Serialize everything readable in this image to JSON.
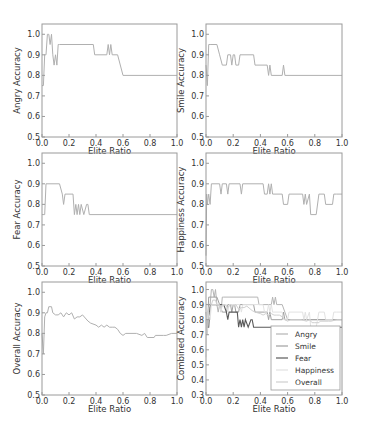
{
  "figure": {
    "xlabel": "Elite Ratio",
    "x_ticks": [
      "0.0",
      "0.2",
      "0.4",
      "0.6",
      "0.8",
      "1.0"
    ]
  },
  "chart_data": [
    {
      "type": "line",
      "title": "",
      "xlabel": "Elite Ratio",
      "ylabel": "Angry Accuracy",
      "xlim": [
        0,
        1
      ],
      "ylim": [
        0.5,
        1.05
      ],
      "y_ticks": [
        "0.5",
        "0.6",
        "0.7",
        "0.8",
        "0.9",
        "1.0"
      ],
      "grid": false,
      "series": [
        {
          "name": "Angry",
          "color": "#b0b0b0",
          "x": [
            0.0,
            0.01,
            0.02,
            0.03,
            0.04,
            0.05,
            0.06,
            0.07,
            0.08,
            0.09,
            0.1,
            0.11,
            0.12,
            0.13,
            0.38,
            0.39,
            0.48,
            0.49,
            0.5,
            0.51,
            0.52,
            0.56,
            0.6,
            1.0
          ],
          "y": [
            0.75,
            0.75,
            0.9,
            0.9,
            1.0,
            1.0,
            0.95,
            1.0,
            0.9,
            0.85,
            0.9,
            0.85,
            0.95,
            0.95,
            0.95,
            0.9,
            0.9,
            0.95,
            0.9,
            0.95,
            0.9,
            0.9,
            0.8,
            0.8
          ]
        }
      ]
    },
    {
      "type": "line",
      "title": "",
      "xlabel": "Elite Ratio",
      "ylabel": "Smile Accuracy",
      "xlim": [
        0,
        1
      ],
      "ylim": [
        0.5,
        1.05
      ],
      "y_ticks": [
        "0.5",
        "0.6",
        "0.7",
        "0.8",
        "0.9",
        "1.0"
      ],
      "grid": false,
      "series": [
        {
          "name": "Smile",
          "color": "#b0b0b0",
          "x": [
            0.0,
            0.01,
            0.02,
            0.03,
            0.08,
            0.1,
            0.12,
            0.15,
            0.16,
            0.18,
            0.19,
            0.2,
            0.21,
            0.22,
            0.24,
            0.25,
            0.35,
            0.36,
            0.45,
            0.46,
            0.47,
            0.48,
            0.56,
            0.57,
            0.58,
            1.0
          ],
          "y": [
            0.85,
            0.75,
            0.95,
            0.95,
            0.95,
            0.9,
            0.85,
            0.85,
            0.9,
            0.9,
            0.85,
            0.9,
            0.9,
            0.85,
            0.85,
            0.9,
            0.9,
            0.85,
            0.85,
            0.8,
            0.85,
            0.8,
            0.8,
            0.85,
            0.8,
            0.8
          ]
        }
      ]
    },
    {
      "type": "line",
      "title": "",
      "xlabel": "Elite Ratio",
      "ylabel": "Fear Accuracy",
      "xlim": [
        0,
        1
      ],
      "ylim": [
        0.5,
        1.05
      ],
      "y_ticks": [
        "0.5",
        "0.6",
        "0.7",
        "0.8",
        "0.9",
        "1.0"
      ],
      "grid": false,
      "series": [
        {
          "name": "Fear",
          "color": "#b0b0b0",
          "x": [
            0.0,
            0.02,
            0.03,
            0.13,
            0.15,
            0.16,
            0.17,
            0.23,
            0.24,
            0.25,
            0.26,
            0.27,
            0.28,
            0.29,
            0.31,
            0.33,
            0.34,
            0.35,
            1.0
          ],
          "y": [
            0.75,
            0.75,
            0.9,
            0.9,
            0.85,
            0.8,
            0.85,
            0.85,
            0.75,
            0.8,
            0.75,
            0.8,
            0.75,
            0.8,
            0.75,
            0.8,
            0.8,
            0.75,
            0.75
          ]
        }
      ]
    },
    {
      "type": "line",
      "title": "",
      "xlabel": "Elite Ratio",
      "ylabel": "Happiness Accuracy",
      "xlim": [
        0,
        1
      ],
      "ylim": [
        0.5,
        1.05
      ],
      "y_ticks": [
        "0.5",
        "0.6",
        "0.7",
        "0.8",
        "0.9",
        "1.0"
      ],
      "grid": false,
      "series": [
        {
          "name": "Happiness",
          "color": "#b0b0b0",
          "x": [
            0.0,
            0.005,
            0.01,
            0.02,
            0.03,
            0.04,
            0.1,
            0.11,
            0.12,
            0.15,
            0.16,
            0.17,
            0.25,
            0.26,
            0.27,
            0.42,
            0.43,
            0.45,
            0.46,
            0.47,
            0.48,
            0.49,
            0.5,
            0.56,
            0.57,
            0.6,
            0.61,
            0.71,
            0.72,
            0.73,
            0.74,
            0.76,
            0.77,
            0.81,
            0.83,
            0.87,
            0.88,
            0.93,
            0.94,
            0.96,
            1.0
          ],
          "y": [
            0.55,
            0.85,
            0.8,
            0.85,
            0.8,
            0.9,
            0.9,
            0.85,
            0.9,
            0.9,
            0.85,
            0.9,
            0.9,
            0.85,
            0.9,
            0.9,
            0.85,
            0.85,
            0.9,
            0.85,
            0.9,
            0.85,
            0.85,
            0.85,
            0.8,
            0.8,
            0.85,
            0.85,
            0.8,
            0.85,
            0.8,
            0.85,
            0.75,
            0.75,
            0.85,
            0.85,
            0.8,
            0.8,
            0.85,
            0.85,
            0.85
          ]
        }
      ]
    },
    {
      "type": "line",
      "title": "",
      "xlabel": "Elite Ratio",
      "ylabel": "Overall Accuracy",
      "xlim": [
        0,
        1
      ],
      "ylim": [
        0.5,
        1.05
      ],
      "y_ticks": [
        "0.5",
        "0.6",
        "0.7",
        "0.8",
        "0.9",
        "1.0"
      ],
      "grid": false,
      "series": [
        {
          "name": "Overall",
          "color": "#b0b0b0",
          "x": [
            0.0,
            0.01,
            0.02,
            0.03,
            0.04,
            0.05,
            0.07,
            0.08,
            0.1,
            0.12,
            0.14,
            0.16,
            0.18,
            0.2,
            0.22,
            0.24,
            0.26,
            0.28,
            0.3,
            0.34,
            0.36,
            0.4,
            0.42,
            0.44,
            0.46,
            0.48,
            0.5,
            0.52,
            0.54,
            0.56,
            0.58,
            0.6,
            0.62,
            0.7,
            0.74,
            0.76,
            0.78,
            0.8,
            0.83,
            0.84,
            0.9,
            0.92,
            0.96,
            1.0
          ],
          "y": [
            0.8,
            0.7,
            0.88,
            0.9,
            0.9,
            0.93,
            0.93,
            0.9,
            0.89,
            0.89,
            0.9,
            0.88,
            0.9,
            0.89,
            0.9,
            0.87,
            0.88,
            0.88,
            0.89,
            0.86,
            0.85,
            0.84,
            0.83,
            0.84,
            0.83,
            0.84,
            0.83,
            0.83,
            0.83,
            0.82,
            0.8,
            0.79,
            0.8,
            0.8,
            0.79,
            0.8,
            0.78,
            0.78,
            0.78,
            0.79,
            0.79,
            0.79,
            0.8,
            0.8
          ]
        }
      ]
    },
    {
      "type": "line",
      "title": "",
      "xlabel": "Elite Ratio",
      "ylabel": "Combined Accuracy",
      "xlim": [
        0,
        1
      ],
      "ylim": [
        0.3,
        1.05
      ],
      "y_ticks": [
        "0.3",
        "0.4",
        "0.5",
        "0.6",
        "0.7",
        "0.8",
        "0.9",
        "1.0"
      ],
      "grid": false,
      "legend": {
        "position": "lower right",
        "entries": [
          "Angry",
          "Smile",
          "Fear",
          "Happiness",
          "Overall"
        ]
      },
      "series": [
        {
          "name": "Angry",
          "color": "#b5b5b5",
          "ref": 0
        },
        {
          "name": "Smile",
          "color": "#a0a0a0",
          "ref": 1
        },
        {
          "name": "Fear",
          "color": "#5a5a5a",
          "ref": 2
        },
        {
          "name": "Happiness",
          "color": "#e2e2e2",
          "ref": 3
        },
        {
          "name": "Overall",
          "color": "#cfcfcf",
          "ref": 4
        }
      ]
    }
  ]
}
